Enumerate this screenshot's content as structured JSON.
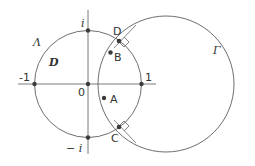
{
  "figure": {
    "curves": {
      "lambda": {
        "label": "Λ",
        "kind": "unit circle"
      },
      "gamma": {
        "label": "Γ",
        "kind": "circle orthogonal to Λ"
      }
    },
    "region_label": "D",
    "axis_labels": {
      "neg_one": "-1",
      "one": "1",
      "zero": "0",
      "i": "i",
      "neg_i": "− i"
    },
    "points": {
      "A": "A",
      "B": "B",
      "C": "C",
      "D": "D"
    },
    "right_angle_markers": [
      "at D",
      "at C"
    ],
    "colors": {
      "stroke": "#6e6e6e",
      "points": "#3a3a3a",
      "text": "#333333"
    }
  }
}
